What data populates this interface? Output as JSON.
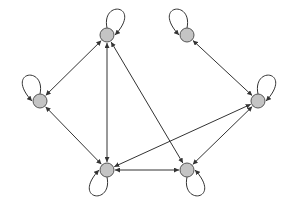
{
  "diagram": {
    "type": "directed-graph",
    "node_fill": "#c4c4c4",
    "node_stroke": "#555555",
    "edge_color": "#333333",
    "node_radius": 7,
    "nodes": [
      {
        "id": "A",
        "x": 107,
        "y": 35,
        "loop": "up-right"
      },
      {
        "id": "B",
        "x": 40,
        "y": 101,
        "loop": "up-left"
      },
      {
        "id": "C",
        "x": 107,
        "y": 170,
        "loop": "down-left"
      },
      {
        "id": "D",
        "x": 187,
        "y": 170,
        "loop": "down-right"
      },
      {
        "id": "E",
        "x": 258,
        "y": 101,
        "loop": "up-right"
      },
      {
        "id": "F",
        "x": 187,
        "y": 35,
        "loop": "up-left"
      }
    ],
    "edges": [
      {
        "from": "A",
        "to": "B",
        "bidirectional": true
      },
      {
        "from": "A",
        "to": "C",
        "bidirectional": true
      },
      {
        "from": "A",
        "to": "D",
        "bidirectional": true
      },
      {
        "from": "B",
        "to": "C",
        "bidirectional": true
      },
      {
        "from": "C",
        "to": "D",
        "bidirectional": true
      },
      {
        "from": "C",
        "to": "E",
        "bidirectional": true
      },
      {
        "from": "D",
        "to": "E",
        "bidirectional": true
      },
      {
        "from": "F",
        "to": "E",
        "bidirectional": true
      }
    ]
  }
}
